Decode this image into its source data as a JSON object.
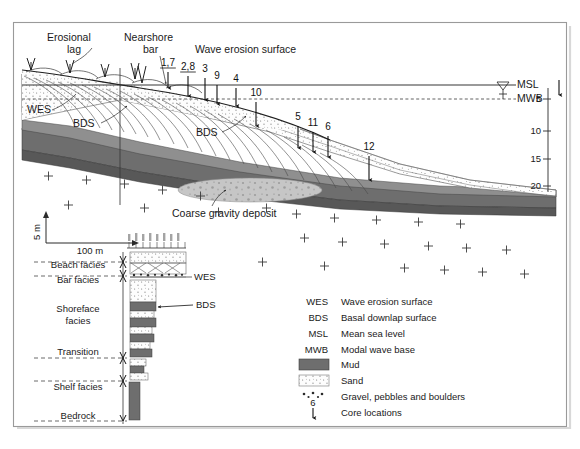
{
  "figure": {
    "type": "geological-cross-section",
    "frame": {
      "border_color": "#9a9a9a",
      "background": "#ffffff"
    }
  },
  "annotations": {
    "erosional_lag": "Erosional\nlag",
    "erosional_lag_line1": "Erosional",
    "erosional_lag_line2": "lag",
    "nearshore_bar_line1": "Nearshore",
    "nearshore_bar_line2": "bar",
    "wave_erosion_surface": "Wave erosion surface",
    "coarse_gravity_deposit": "Coarse gravity deposit",
    "wes_main": "WES",
    "bds_left": "BDS",
    "bds_right": "BDS"
  },
  "sea_levels": {
    "msl": "MSL",
    "mwb": "MWB"
  },
  "depth_axis": {
    "unit_implied": "m",
    "ticks": [
      "5",
      "10",
      "15",
      "20"
    ]
  },
  "scale_bar": {
    "vertical": "5 m",
    "horizontal": "100 m"
  },
  "cores": [
    {
      "label": "1,7",
      "x": 168,
      "y_label": 66,
      "arrow_from_y": 72,
      "arrow_to_y": 88,
      "underline": true
    },
    {
      "label": "2,8",
      "x": 188,
      "y_label": 70,
      "arrow_from_y": 76,
      "arrow_to_y": 96,
      "underline": true
    },
    {
      "label": "3",
      "x": 205,
      "y_label": 72,
      "arrow_from_y": 78,
      "arrow_to_y": 100,
      "underline": false
    },
    {
      "label": "9",
      "x": 217,
      "y_label": 79,
      "arrow_from_y": 85,
      "arrow_to_y": 104,
      "underline": false
    },
    {
      "label": "4",
      "x": 236,
      "y_label": 82,
      "arrow_from_y": 88,
      "arrow_to_y": 106,
      "underline": false
    },
    {
      "label": "10",
      "x": 256,
      "y_label": 96,
      "arrow_from_y": 102,
      "arrow_to_y": 126,
      "underline": false
    },
    {
      "label": "5",
      "x": 298,
      "y_label": 120,
      "arrow_from_y": 126,
      "arrow_to_y": 148,
      "underline": false
    },
    {
      "label": "11",
      "x": 313,
      "y_label": 126,
      "arrow_from_y": 132,
      "arrow_to_y": 152,
      "underline": false
    },
    {
      "label": "6",
      "x": 328,
      "y_label": 130,
      "arrow_from_y": 136,
      "arrow_to_y": 157,
      "underline": false
    },
    {
      "label": "12",
      "x": 369,
      "y_label": 150,
      "arrow_from_y": 156,
      "arrow_to_y": 180,
      "underline": false
    }
  ],
  "facies_column": {
    "labels": [
      {
        "text": "Beach facies",
        "y": 268
      },
      {
        "text": "Bar facies",
        "y": 283
      },
      {
        "text": "Shoreface",
        "y": 312
      },
      {
        "text": "facies",
        "y": 324
      },
      {
        "text": "Transition",
        "y": 355
      },
      {
        "text": "Shelf facies",
        "y": 390
      },
      {
        "text": "Bedrock",
        "y": 419
      }
    ],
    "callouts": {
      "wes": "WES",
      "bds": "BDS"
    }
  },
  "legend": {
    "abbreviations": [
      {
        "key": "WES",
        "text": "Wave erosion surface"
      },
      {
        "key": "BDS",
        "text": "Basal downlap surface"
      },
      {
        "key": "MSL",
        "text": "Mean sea level"
      },
      {
        "key": "MWB",
        "text": "Modal wave base"
      }
    ],
    "patterns": [
      {
        "swatch": "mud-swatch",
        "text": "Mud"
      },
      {
        "swatch": "sand-swatch",
        "text": "Sand"
      },
      {
        "swatch": "gravel-swatch",
        "text": "Gravel, pebbles and boulders"
      },
      {
        "swatch": "core-swatch",
        "text": "Core locations",
        "symbol_number": "6"
      }
    ]
  },
  "colors": {
    "mud": "#6e6e6e",
    "mud_dark": "#555555",
    "sand": "#fdfdfd",
    "sand_dot": "#8d8d8d",
    "gravel": "#c9c9c9",
    "bedrock_cross": "#3a3a3a",
    "line": "#2a2a2a",
    "frame": "#9a9a9a"
  }
}
